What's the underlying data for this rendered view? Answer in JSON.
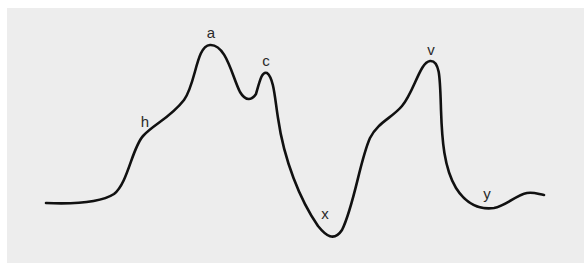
{
  "diagram": {
    "background": "#ededed",
    "curve_color": "#111111",
    "label_color": "#2a2a2a",
    "labels": [
      {
        "id": "h",
        "text": "h",
        "x": 145,
        "y": 121,
        "description": "shoulder on first rise"
      },
      {
        "id": "a",
        "text": "a",
        "x": 211,
        "y": 32,
        "description": "highest peak"
      },
      {
        "id": "c",
        "text": "c",
        "x": 266,
        "y": 60,
        "description": "secondary peak after dip"
      },
      {
        "id": "x",
        "text": "x",
        "x": 325,
        "y": 213,
        "description": "deep trough"
      },
      {
        "id": "v",
        "text": "v",
        "x": 431,
        "y": 49,
        "description": "second major peak"
      },
      {
        "id": "y",
        "text": "y",
        "x": 487,
        "y": 193,
        "description": "shallow trough near end"
      }
    ],
    "curve_path": "M46,203 C70,204 100,203 114,194 C128,183 132,148 143,136 C154,124 170,118 184,100 C196,84 196,46 210,45 C226,44 232,76 240,92 C246,102 252,100 256,94 C260,80 262,71 267,73 C274,78 275,100 278,118 C284,160 300,200 318,226 C326,236 334,242 342,230 C354,206 360,160 370,138 C378,122 392,118 402,106 C414,92 420,62 430,61 C440,60 440,78 441,110 C442,140 444,168 456,188 C466,204 480,210 494,208 C506,206 516,195 527,193 C534,192 538,194 544,195"
  }
}
